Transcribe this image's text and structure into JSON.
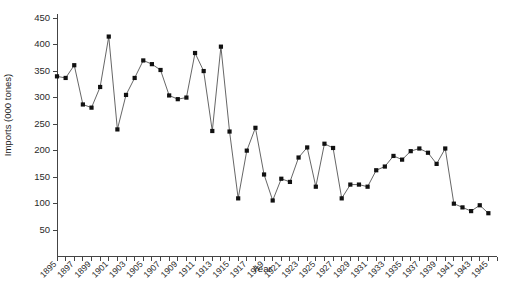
{
  "chart_data": {
    "type": "line",
    "title": "",
    "xlabel": "Year",
    "ylabel": "Imports (000 tones)",
    "grid": false,
    "legend": false,
    "marker": "filled-square",
    "xlim": [
      1895,
      1946
    ],
    "ylim": [
      0,
      450
    ],
    "ytick_step": 50,
    "yticks": [
      0,
      50,
      100,
      150,
      200,
      250,
      300,
      350,
      400,
      450
    ],
    "ytick_labels": [
      "",
      "50",
      "100",
      "150",
      "200",
      "250",
      "300",
      "350",
      "400",
      "450"
    ],
    "xticks": [
      1895,
      1896,
      1897,
      1898,
      1899,
      1900,
      1901,
      1902,
      1903,
      1904,
      1905,
      1906,
      1907,
      1908,
      1909,
      1910,
      1911,
      1912,
      1913,
      1914,
      1915,
      1916,
      1917,
      1918,
      1919,
      1920,
      1921,
      1922,
      1923,
      1924,
      1925,
      1926,
      1927,
      1928,
      1929,
      1930,
      1931,
      1932,
      1933,
      1934,
      1935,
      1936,
      1937,
      1938,
      1939,
      1940,
      1941,
      1942,
      1943,
      1944,
      1945,
      1946
    ],
    "xtick_labels": [
      "1895",
      "1897",
      "1899",
      "1901",
      "1903",
      "1905",
      "1907",
      "1909",
      "1911",
      "1913",
      "1915",
      "1917",
      "1919",
      "1921",
      "1923",
      "1925",
      "1927",
      "1929",
      "1931",
      "1933",
      "1935",
      "1937",
      "1939",
      "1941",
      "1943",
      "1945"
    ],
    "xtick_label_years": [
      1895,
      1897,
      1899,
      1901,
      1903,
      1905,
      1907,
      1909,
      1911,
      1913,
      1915,
      1917,
      1919,
      1921,
      1923,
      1925,
      1927,
      1929,
      1931,
      1933,
      1935,
      1937,
      1939,
      1941,
      1943,
      1945
    ],
    "x": [
      1895,
      1896,
      1897,
      1898,
      1899,
      1900,
      1901,
      1902,
      1903,
      1904,
      1905,
      1906,
      1907,
      1908,
      1909,
      1910,
      1911,
      1912,
      1913,
      1914,
      1915,
      1916,
      1917,
      1918,
      1919,
      1920,
      1921,
      1922,
      1923,
      1924,
      1925,
      1926,
      1927,
      1928,
      1929,
      1930,
      1931,
      1932,
      1933,
      1934,
      1935,
      1936,
      1937,
      1938,
      1939,
      1940,
      1941,
      1942,
      1943,
      1944,
      1945
    ],
    "values": [
      340,
      337,
      361,
      287,
      281,
      320,
      415,
      240,
      305,
      337,
      370,
      363,
      352,
      304,
      297,
      300,
      384,
      350,
      237,
      396,
      236,
      110,
      200,
      243,
      155,
      106,
      147,
      141,
      187,
      206,
      132,
      213,
      205,
      110,
      136,
      136,
      132,
      163,
      170,
      190,
      183,
      199,
      204,
      196,
      175,
      204,
      100,
      93,
      86,
      97,
      82
    ],
    "series": [
      {
        "name": "Imports",
        "color": "#111111",
        "values": [
          340,
          337,
          361,
          287,
          281,
          320,
          415,
          240,
          305,
          337,
          370,
          363,
          352,
          304,
          297,
          300,
          384,
          350,
          237,
          396,
          236,
          110,
          200,
          243,
          155,
          106,
          147,
          141,
          187,
          206,
          132,
          213,
          205,
          110,
          136,
          136,
          132,
          163,
          170,
          190,
          183,
          199,
          204,
          196,
          175,
          204,
          100,
          93,
          86,
          97,
          82
        ]
      }
    ]
  },
  "colors": {
    "axis": "#444444",
    "line": "#555555",
    "marker": "#111111",
    "background": "#ffffff"
  }
}
